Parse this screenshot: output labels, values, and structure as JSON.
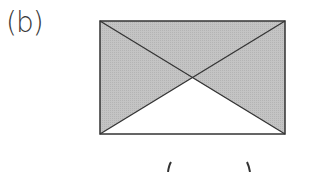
{
  "figure": {
    "label": "(b)",
    "rectangle": {
      "x1": 100,
      "y1": 21,
      "x2": 285,
      "y2": 134
    },
    "shade_color": "#c2c2c2",
    "stroke_color": "#333333",
    "shaded_regions": [
      "top",
      "left",
      "right"
    ],
    "unshaded_regions": [
      "bottom"
    ],
    "bottom_text": "(      )"
  }
}
